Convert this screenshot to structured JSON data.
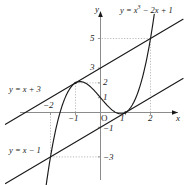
{
  "figure": {
    "kind": "cartesian-graph",
    "background": "#ffffff",
    "ink": "#1a1a1a",
    "guide_color": "#a8a8a8",
    "axis_color": "#8c8c8c"
  },
  "axes": {
    "x_name": "x",
    "y_name": "y",
    "origin_label": "O",
    "x_ticks": [
      {
        "value": -2,
        "label": "−2"
      },
      {
        "value": -1,
        "label": "−1"
      },
      {
        "value": 1,
        "label": "1"
      },
      {
        "value": 2,
        "label": "2"
      }
    ],
    "y_ticks": [
      {
        "value": 5,
        "label": "5"
      },
      {
        "value": 3,
        "label": "3"
      },
      {
        "value": 2,
        "label": "2"
      },
      {
        "value": 1,
        "label": "1"
      },
      {
        "value": -1,
        "label": "−1"
      },
      {
        "value": -3,
        "label": "−3"
      }
    ]
  },
  "curve_labels": {
    "cubic_lhs": "y = x",
    "cubic_exp": "3",
    "cubic_rhs": " − 2x + 1",
    "cubic_full": "y = x³ − 2x + 1",
    "line_upper": "y = x + 3",
    "line_lower": "y = x − 1"
  },
  "chart_data": {
    "type": "line",
    "title": "",
    "xlabel": "x",
    "ylabel": "y",
    "xlim": [
      -3.8,
      3.3
    ],
    "ylim": [
      -5.2,
      5.8
    ],
    "grid": false,
    "legend": "inline-annotations",
    "x_ticks": [
      -2,
      -1,
      1,
      2
    ],
    "y_ticks": [
      5,
      3,
      2,
      1,
      -1,
      -3
    ],
    "series": [
      {
        "name": "y = x³ − 2x + 1",
        "kind": "cubic",
        "coefficients": {
          "a": 1,
          "b": 0,
          "c": -2,
          "d": 1
        },
        "x_domain": [
          -2.35,
          2.15
        ],
        "features": {
          "local_max": [
            -1,
            2
          ],
          "local_min": [
            0.8165,
            -0.0887
          ],
          "y_intercept": [
            0,
            1
          ],
          "root_exact": [
            1,
            0
          ]
        }
      },
      {
        "name": "y = x + 3",
        "kind": "line",
        "slope": 1,
        "intercept": 3,
        "x_domain": [
          -3.8,
          3.3
        ]
      },
      {
        "name": "y = x − 1",
        "kind": "line",
        "slope": 1,
        "intercept": -1,
        "x_domain": [
          -3.8,
          3.3
        ]
      }
    ],
    "intersections": [
      {
        "point": [
          -1,
          2
        ],
        "between": [
          "y = x³ − 2x + 1",
          "y = x + 3"
        ]
      },
      {
        "point": [
          2,
          5
        ],
        "between": [
          "y = x³ − 2x + 1",
          "y = x + 3"
        ]
      },
      {
        "point": [
          -2,
          -3
        ],
        "between": [
          "y = x³ − 2x + 1",
          "y = x − 1"
        ]
      },
      {
        "point": [
          1,
          0
        ],
        "between": [
          "y = x³ − 2x + 1",
          "y = x − 1"
        ]
      }
    ],
    "guide_lines": [
      {
        "to": [
          -1,
          2
        ],
        "style": "dotted"
      },
      {
        "to": [
          2,
          5
        ],
        "style": "dotted"
      },
      {
        "to": [
          -2,
          -3
        ],
        "style": "dotted"
      }
    ]
  }
}
